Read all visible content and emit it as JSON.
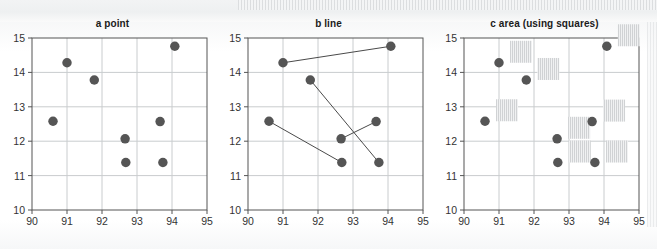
{
  "figure": {
    "width": 657,
    "height": 249,
    "background": "#ffffff"
  },
  "chart_data": [
    {
      "type": "scatter",
      "title": "a  point",
      "panel_label": "a",
      "panel_kind": "point",
      "xlabel": "",
      "ylabel": "",
      "xlim": [
        90,
        95
      ],
      "ylim": [
        10,
        15
      ],
      "xticks": [
        "90",
        "91",
        "92",
        "93",
        "94",
        "95"
      ],
      "yticks": [
        "10",
        "11",
        "12",
        "13",
        "14",
        "15"
      ],
      "grid": true,
      "legend": "none",
      "marker_color": "#555555",
      "marker_size": 5,
      "points": [
        {
          "x": 90.6,
          "y": 12.58
        },
        {
          "x": 91.0,
          "y": 14.28
        },
        {
          "x": 91.78,
          "y": 13.78
        },
        {
          "x": 92.66,
          "y": 12.07
        },
        {
          "x": 92.68,
          "y": 11.38
        },
        {
          "x": 93.66,
          "y": 12.57
        },
        {
          "x": 93.74,
          "y": 11.38
        },
        {
          "x": 94.08,
          "y": 14.76
        }
      ]
    },
    {
      "type": "line",
      "title": "b  line",
      "panel_label": "b",
      "panel_kind": "line",
      "xlabel": "",
      "ylabel": "",
      "xlim": [
        90,
        95
      ],
      "ylim": [
        10,
        15
      ],
      "xticks": [
        "90",
        "91",
        "92",
        "93",
        "94",
        "95"
      ],
      "yticks": [
        "10",
        "11",
        "12",
        "13",
        "14",
        "15"
      ],
      "grid": true,
      "legend": "none",
      "marker_color": "#555555",
      "line_color": "#4a4a4a",
      "line_width": 1,
      "points": [
        {
          "x": 90.6,
          "y": 12.58
        },
        {
          "x": 91.0,
          "y": 14.28
        },
        {
          "x": 91.78,
          "y": 13.78
        },
        {
          "x": 92.66,
          "y": 12.07
        },
        {
          "x": 92.68,
          "y": 11.38
        },
        {
          "x": 93.66,
          "y": 12.57
        },
        {
          "x": 93.74,
          "y": 11.38
        },
        {
          "x": 94.08,
          "y": 14.76
        }
      ],
      "segments": [
        {
          "x1": 91.0,
          "y1": 14.28,
          "x2": 94.08,
          "y2": 14.76
        },
        {
          "x1": 91.78,
          "y1": 13.78,
          "x2": 93.74,
          "y2": 11.38
        },
        {
          "x1": 90.6,
          "y1": 12.58,
          "x2": 92.68,
          "y2": 11.38
        },
        {
          "x1": 92.66,
          "y1": 12.07,
          "x2": 93.66,
          "y2": 12.57
        }
      ]
    },
    {
      "type": "scatter",
      "title": "c  area (using squares)",
      "panel_label": "c",
      "panel_kind": "area (using squares)",
      "xlabel": "",
      "ylabel": "",
      "xlim": [
        90,
        95
      ],
      "ylim": [
        10,
        15
      ],
      "xticks": [
        "90",
        "91",
        "92",
        "93",
        "94",
        "95"
      ],
      "yticks": [
        "10",
        "11",
        "12",
        "13",
        "14",
        "15"
      ],
      "grid": true,
      "legend": "none",
      "marker_color": "#555555",
      "square_fill": "#d0d2d4",
      "square_hatch": "vertical-lines",
      "square_size_px": 22,
      "square_offset_px": {
        "x": 11,
        "y": -11
      },
      "points": [
        {
          "x": 90.6,
          "y": 12.58
        },
        {
          "x": 91.0,
          "y": 14.28
        },
        {
          "x": 91.78,
          "y": 13.78
        },
        {
          "x": 92.66,
          "y": 12.07
        },
        {
          "x": 92.68,
          "y": 11.38
        },
        {
          "x": 93.66,
          "y": 12.57
        },
        {
          "x": 93.74,
          "y": 11.38
        },
        {
          "x": 94.08,
          "y": 14.76
        }
      ]
    }
  ],
  "panels_layout": [
    {
      "left": 0,
      "plot_left": 32,
      "plot_top": 38,
      "plot_right": 207,
      "plot_bottom": 210
    },
    {
      "left": 216,
      "plot_left": 248,
      "plot_top": 38,
      "plot_right": 423,
      "plot_bottom": 210
    },
    {
      "left": 432,
      "plot_left": 464,
      "plot_top": 38,
      "plot_right": 639,
      "plot_bottom": 210
    }
  ],
  "style": {
    "axis_color": "#555555",
    "grid_color": "#c9ccce",
    "title_color": "#1b1b1b",
    "tick_color": "#333333",
    "plot_background": "#ffffff"
  }
}
